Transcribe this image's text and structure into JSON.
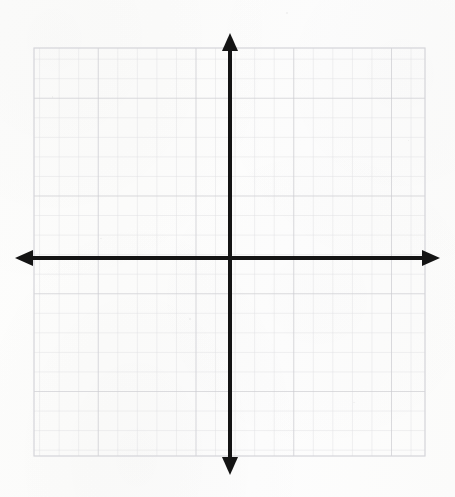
{
  "document": {
    "title": "Blank Coordinate Plane",
    "type": "graph-paper-worksheet",
    "canvas": {
      "width": 455,
      "height": 497
    },
    "background_color": "#fdfdfc"
  },
  "chart_data": {
    "type": "scatter",
    "title": "",
    "subtitle": "",
    "xlabel": "",
    "ylabel": "",
    "series": [],
    "x": [],
    "values": [],
    "annotations": [],
    "legend": {
      "entries": [],
      "position": "none"
    },
    "grid": {
      "visible": true,
      "minor_cell_px": 19.55,
      "major_every": 5,
      "columns": 20,
      "rows": 21,
      "left_px": 34,
      "top_px": 48,
      "right_px": 425,
      "bottom_px": 456,
      "minor_color": "#dddde1",
      "major_color": "#c9c9ce",
      "border_color": "#d4d4d9"
    },
    "axes": {
      "origin_px": {
        "x": 230,
        "y": 258
      },
      "xlim": [
        -10,
        10
      ],
      "ylim": [
        -10,
        11
      ],
      "tick_labels_visible": false,
      "axis_color": "#141414",
      "axis_width_px": 4,
      "x_axis": {
        "label": "x",
        "start_px": 15,
        "end_px": 440,
        "y_px": 258,
        "arrow_start": true,
        "arrow_end": true
      },
      "y_axis": {
        "label": "y",
        "x_px": 230,
        "start_px": 33,
        "end_px": 475,
        "arrow_start": true,
        "arrow_end": true
      }
    }
  },
  "elements": {
    "grid_name": "coordinate-grid",
    "x_axis_name": "x-axis",
    "y_axis_name": "y-axis",
    "origin_name": "origin"
  }
}
